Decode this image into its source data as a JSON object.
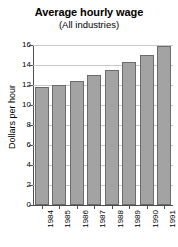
{
  "chart_data": {
    "type": "bar",
    "title": "Average hourly wage",
    "subtitle": "(All industries)",
    "xlabel": "",
    "ylabel": "Dollars per hour",
    "categories": [
      "1984",
      "1985",
      "1986",
      "1987",
      "1988",
      "1989",
      "1990",
      "1991"
    ],
    "values": [
      11.8,
      12.0,
      12.4,
      13.0,
      13.5,
      14.3,
      15.0,
      15.9
    ],
    "ylim": [
      0,
      16
    ],
    "ytick_labels": [
      "0",
      "2",
      "4",
      "6",
      "8",
      "10",
      "12",
      "14",
      "16"
    ],
    "ytick_values": [
      0,
      2,
      4,
      6,
      8,
      10,
      12,
      14,
      16
    ],
    "grid": "horizontal",
    "legend": "none",
    "bar_fill_color": "#a3a3a3",
    "bar_border_color": "#6b6b6b",
    "gridline_color": "#c9c9c9",
    "axis_color": "#4d4d4d",
    "background_color": "#ffffff",
    "text_color": "#000000"
  }
}
